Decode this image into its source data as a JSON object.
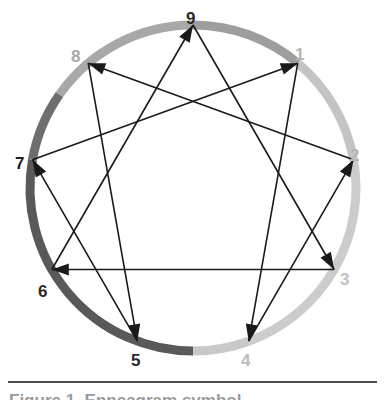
{
  "figure": {
    "caption_partial": "Figure 1. Enneagram symbol",
    "background_color": "#ffffff"
  },
  "circle": {
    "center_x": 193,
    "center_y": 188,
    "radius": 163,
    "stroke_width": 9,
    "arcs": [
      {
        "name": "arc-9-to-1",
        "from_point": "9",
        "to_point": "1",
        "color": "#9e9e9e",
        "start_angle_deg": -90,
        "end_angle_deg": -50
      },
      {
        "name": "arc-1-to-2",
        "from_point": "1",
        "to_point": "2",
        "color": "#c4c4c4",
        "start_angle_deg": -50,
        "end_angle_deg": -10
      },
      {
        "name": "arc-2-to-4",
        "from_point": "2",
        "to_point": "4",
        "color": "#cccccc",
        "start_angle_deg": -10,
        "end_angle_deg": 70
      },
      {
        "name": "arc-4-to-5",
        "from_point": "4",
        "to_point": "5",
        "color": "#c9c9c9",
        "start_angle_deg": 70,
        "end_angle_deg": 90
      },
      {
        "name": "arc-5-to-7",
        "from_point": "5",
        "to_point": "7",
        "color": "#595959",
        "start_angle_deg": 90,
        "end_angle_deg": 190
      },
      {
        "name": "arc-7-to-8",
        "from_point": "7",
        "to_point": "8",
        "color": "#6e6e6e",
        "start_angle_deg": 190,
        "end_angle_deg": 215
      },
      {
        "name": "arc-8-to-9",
        "from_point": "8",
        "to_point": "9",
        "color": "#a8a8a8",
        "start_angle_deg": 215,
        "end_angle_deg": 270
      }
    ]
  },
  "points": [
    {
      "id": "9",
      "label": "9",
      "angle_deg": -90,
      "label_color": "#2a2a2a",
      "label_x": 186,
      "label_y": 10
    },
    {
      "id": "1",
      "label": "1",
      "angle_deg": -50,
      "label_color": "#b5b5b5",
      "label_x": 295,
      "label_y": 46
    },
    {
      "id": "2",
      "label": "2",
      "angle_deg": -10,
      "label_color": "#b5b5b5",
      "label_x": 350,
      "label_y": 147
    },
    {
      "id": "3",
      "label": "3",
      "angle_deg": 30,
      "label_color": "#c2c2c2",
      "label_x": 340,
      "label_y": 271
    },
    {
      "id": "4",
      "label": "4",
      "angle_deg": 70,
      "label_color": "#bdbdbd",
      "label_x": 241,
      "label_y": 352
    },
    {
      "id": "5",
      "label": "5",
      "angle_deg": 110,
      "label_color": "#2a2a2a",
      "label_x": 131,
      "label_y": 352
    },
    {
      "id": "6",
      "label": "6",
      "angle_deg": 150,
      "label_color": "#2a2a2a",
      "label_x": 38,
      "label_y": 283
    },
    {
      "id": "7",
      "label": "7",
      "angle_deg": 190,
      "label_color": "#1e1e1e",
      "label_x": 15,
      "label_y": 155
    },
    {
      "id": "8",
      "label": "8",
      "angle_deg": 230,
      "label_color": "#a8a8a8",
      "label_x": 71,
      "label_y": 48
    }
  ],
  "connections": {
    "line_color": "#1a1a1a",
    "line_width": 1.6,
    "triangle": {
      "name": "inner-triangle",
      "sequence": [
        "9",
        "3",
        "6",
        "9"
      ],
      "edges": [
        {
          "from": "9",
          "to": "3",
          "arrow_at": "3"
        },
        {
          "from": "3",
          "to": "6",
          "arrow_at": "6"
        },
        {
          "from": "6",
          "to": "9",
          "arrow_at": "9"
        }
      ]
    },
    "hexad": {
      "name": "inner-hexad",
      "sequence": [
        "1",
        "4",
        "2",
        "8",
        "5",
        "7",
        "1"
      ],
      "edges": [
        {
          "from": "1",
          "to": "4",
          "arrow_at": "4"
        },
        {
          "from": "4",
          "to": "2",
          "arrow_at": "2"
        },
        {
          "from": "2",
          "to": "8",
          "arrow_at": "8"
        },
        {
          "from": "8",
          "to": "5",
          "arrow_at": "5"
        },
        {
          "from": "5",
          "to": "7",
          "arrow_at": "7"
        },
        {
          "from": "7",
          "to": "1",
          "arrow_at": "1"
        }
      ]
    }
  }
}
